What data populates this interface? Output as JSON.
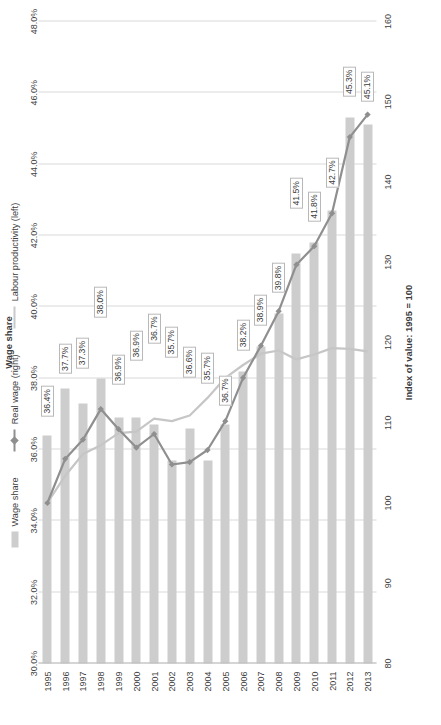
{
  "legend": {
    "items": [
      {
        "label": "Wage share",
        "marker": "bar-swatch",
        "color": "#cdcdcd"
      },
      {
        "label": "Real wage (right)",
        "marker": "line-marker",
        "color": "#8f8f8f"
      },
      {
        "label": "Labour productivity (left)",
        "marker": "line",
        "color": "#cacaca"
      }
    ]
  },
  "chart_data": {
    "type": "bar",
    "title": "",
    "categories": [
      "1995",
      "1996",
      "1997",
      "1998",
      "1999",
      "2000",
      "2001",
      "2002",
      "2003",
      "2004",
      "2005",
      "2006",
      "2007",
      "2008",
      "2009",
      "2010",
      "2011",
      "2012",
      "2013"
    ],
    "xlabel": "Index of value: 1995 = 100",
    "ylabel": "",
    "secondary_axis_title": "Wage share",
    "primary_ticks": [
      80,
      90,
      100,
      110,
      120,
      130,
      140,
      150,
      160
    ],
    "primary_lim": [
      80,
      160
    ],
    "secondary_ticks": [
      "30.0%",
      "32.0%",
      "34.0%",
      "36.0%",
      "38.0%",
      "40.0%",
      "42.0%",
      "44.0%",
      "46.0%",
      "48.0%"
    ],
    "secondary_lim": [
      30.0,
      48.0
    ],
    "grid": "vertical",
    "legend_position": "top",
    "series": [
      {
        "name": "Wage share",
        "axis": "secondary",
        "unit": "%",
        "values": [
          36.4,
          37.7,
          37.3,
          38.0,
          36.9,
          36.9,
          36.7,
          35.7,
          36.6,
          35.7,
          36.7,
          38.2,
          38.9,
          39.8,
          41.5,
          41.8,
          42.7,
          45.3,
          45.1
        ],
        "labels": [
          "36.4%",
          "37.7%",
          "37.3%",
          "38.0%",
          "36.9%",
          "36.9%",
          "36.7%",
          "35.7%",
          "36.6%",
          "35.7%",
          "36.7%",
          "38.2%",
          "38.9%",
          "39.8%",
          "41.5%",
          "41.8%",
          "42.7%",
          "45.3%",
          "45.1%"
        ]
      },
      {
        "name": "Real wage (right)",
        "axis": "primary",
        "values": [
          100.0,
          105.5,
          107.9,
          111.7,
          109.2,
          106.9,
          108.6,
          104.8,
          105.1,
          106.6,
          110.2,
          115.6,
          119.6,
          123.9,
          129.7,
          132.0,
          136.1,
          145.6,
          148.4
        ]
      },
      {
        "name": "Labour productivity (left)",
        "axis": "primary",
        "values": [
          100.0,
          103.4,
          106.1,
          107.2,
          108.7,
          108.9,
          110.5,
          110.2,
          110.9,
          113.1,
          115.6,
          117.2,
          118.6,
          119.0,
          117.9,
          118.5,
          119.3,
          119.2,
          118.9
        ]
      }
    ]
  }
}
